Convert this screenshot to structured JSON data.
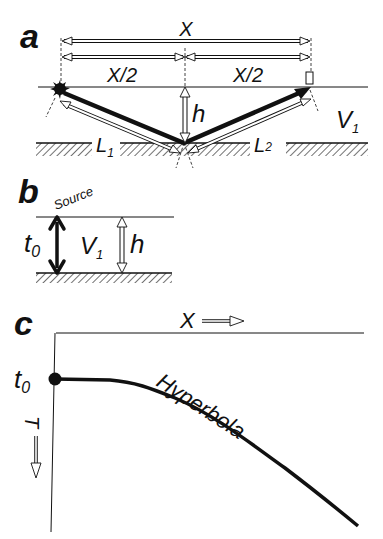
{
  "panels": {
    "a": {
      "letter": "a",
      "x_label": "X",
      "half_left_label": "X/2",
      "half_right_label": "X/2",
      "depth_label": "h",
      "velocity_label": "V",
      "velocity_sub": "1",
      "path1_label": "L",
      "path1_sub": "1",
      "path2_label": "L",
      "path2_sub": "2"
    },
    "b": {
      "letter": "b",
      "source_label": "Source",
      "time_label": "t",
      "time_sub": "0",
      "velocity_label": "V",
      "velocity_sub": "1",
      "depth_label": "h"
    },
    "c": {
      "letter": "c",
      "x_axis_label": "X",
      "t_axis_label": "T",
      "t0_label": "t",
      "t0_sub": "0",
      "curve_label": "Hyperbola"
    }
  },
  "colors": {
    "ink": "#111111",
    "background": "#ffffff"
  }
}
